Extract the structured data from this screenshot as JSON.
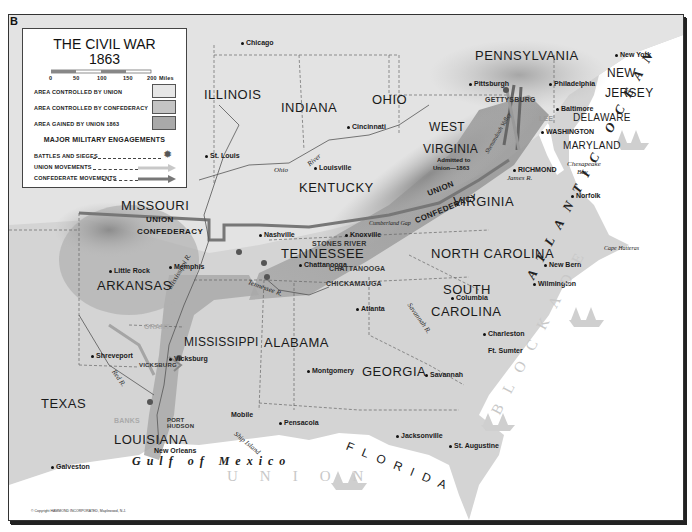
{
  "panel_letter": "B",
  "legend": {
    "title_line1": "THE CIVIL WAR",
    "title_line2": "1863",
    "scale": {
      "ticks": [
        "0",
        "50",
        "100",
        "150",
        "200"
      ],
      "unit": "Miles"
    },
    "areas": [
      {
        "label": "AREA CONTROLLED BY UNION",
        "color": "#e6e6e6"
      },
      {
        "label": "AREA CONTROLLED BY CONFEDERACY",
        "color": "#c4c4c4"
      },
      {
        "label": "AREA GAINED BY UNION 1863",
        "color": "#a9a9a9"
      }
    ],
    "engagements_heading": "MAJOR MILITARY ENGAGEMENTS",
    "engagements": [
      {
        "label": "BATTLES AND SIEGES",
        "symbol": "burst-icon"
      },
      {
        "label": "UNION MOVEMENTS",
        "symbol": "light-arrow-icon"
      },
      {
        "label": "CONFEDERATE MOVEMENTS",
        "symbol": "dark-arrow-icon"
      }
    ]
  },
  "states": {
    "illinois": "ILLINOIS",
    "indiana": "INDIANA",
    "ohio": "OHIO",
    "pennsylvania": "PENNSYLVANIA",
    "new_jersey_1": "NEW",
    "new_jersey_2": "JERSEY",
    "delaware": "DELAWARE",
    "maryland": "MARYLAND",
    "west_virginia_1": "WEST",
    "west_virginia_2": "VIRGINIA",
    "west_virginia_note_1": "Admitted to",
    "west_virginia_note_2": "Union—1863",
    "virginia": "VIRGINIA",
    "kentucky": "KENTUCKY",
    "missouri": "MISSOURI",
    "tennessee": "TENNESSEE",
    "north_carolina": "NORTH CAROLINA",
    "south_carolina_1": "SOUTH",
    "south_carolina_2": "CAROLINA",
    "arkansas": "ARKANSAS",
    "mississippi": "MISSISSIPPI",
    "alabama": "ALABAMA",
    "georgia": "GEORGIA",
    "texas": "TEXAS",
    "louisiana": "LOUISIANA",
    "florida": "F L O R I D A"
  },
  "line_labels": {
    "west_union": "UNION",
    "west_confederacy": "CONFEDERACY",
    "east_union": "UNION",
    "east_confederacy": "CONFEDERACY"
  },
  "cities": [
    {
      "name": "Chicago"
    },
    {
      "name": "St. Louis"
    },
    {
      "name": "Cincinnati"
    },
    {
      "name": "Louisville"
    },
    {
      "name": "Pittsburgh"
    },
    {
      "name": "Philadelphia"
    },
    {
      "name": "New York"
    },
    {
      "name": "Baltimore"
    },
    {
      "name": "WASHINGTON"
    },
    {
      "name": "RICHMOND"
    },
    {
      "name": "Norfolk"
    },
    {
      "name": "Nashville"
    },
    {
      "name": "Knoxville"
    },
    {
      "name": "Chattanooga"
    },
    {
      "name": "Memphis"
    },
    {
      "name": "Little Rock"
    },
    {
      "name": "New Bern"
    },
    {
      "name": "Wilmington"
    },
    {
      "name": "Columbia"
    },
    {
      "name": "Charleston"
    },
    {
      "name": "Ft. Sumter"
    },
    {
      "name": "Atlanta"
    },
    {
      "name": "Savannah"
    },
    {
      "name": "Montgomery"
    },
    {
      "name": "Vicksburg"
    },
    {
      "name": "Shreveport"
    },
    {
      "name": "Mobile"
    },
    {
      "name": "Pensacola"
    },
    {
      "name": "Jacksonville"
    },
    {
      "name": "St. Augustine"
    },
    {
      "name": "New Orleans"
    },
    {
      "name": "Galveston"
    },
    {
      "name": "Ship Island"
    },
    {
      "name": "Cape Hatteras"
    }
  ],
  "battles": [
    "GETTYSBURG",
    "LEE",
    "STONES RIVER",
    "CHATTANOOGA",
    "CHICKAMAUGA",
    "VICKSBURG",
    "PORT HUDSON",
    "BANKS",
    "GRANT"
  ],
  "rivers": [
    "Ohio",
    "River",
    "Mississippi R.",
    "Tennessee R.",
    "Red R.",
    "James R.",
    "Savannah R.",
    "Shenandoah Valley",
    "Cumberland Gap"
  ],
  "water": {
    "ocean": "ATLANTIC OCEAN",
    "blockade": "BLOCKADE",
    "union_blockade": "UNION",
    "gulf": "Gulf of Mexico",
    "bay_1": "Chesapeake",
    "bay_2": "Bay"
  },
  "copyright": "© Copyright HAMMOND INCORPORATED, Maplewood, N.J."
}
